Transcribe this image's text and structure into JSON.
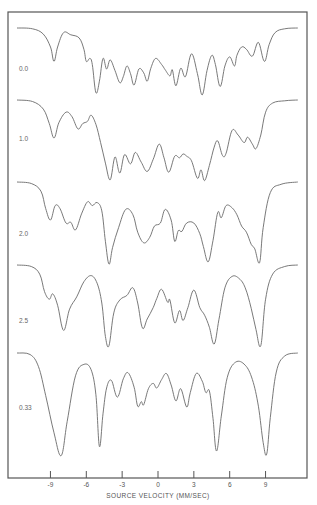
{
  "chart_data": {
    "type": "line",
    "title": "",
    "xlabel": "SOURCE VELOCITY (MM/SEC)",
    "ylabel": "",
    "xlim": [
      -12.5,
      12.3
    ],
    "xticks": [
      -9,
      -6,
      -3,
      0,
      3,
      6,
      9
    ],
    "xtick_labels": [
      "-9",
      "-6",
      "-3",
      "0",
      "3",
      "6",
      "9"
    ],
    "grid": false,
    "legend": "none; series labelled at left of each trace",
    "y_units": "relative transmission (baseline 0, absorption negative), traces offset vertically",
    "series": [
      {
        "name": "0.0",
        "label": "0.0",
        "points": [
          [
            -11.8,
            0
          ],
          [
            -10.5,
            -0.1
          ],
          [
            -9.6,
            -0.8
          ],
          [
            -9.0,
            -2.5
          ],
          [
            -8.7,
            -4.4
          ],
          [
            -8.4,
            -2.5
          ],
          [
            -7.9,
            -0.6
          ],
          [
            -7.3,
            -0.9
          ],
          [
            -6.6,
            -1.3
          ],
          [
            -6.2,
            -2.8
          ],
          [
            -6.0,
            -4.4
          ],
          [
            -5.7,
            -4.0
          ],
          [
            -5.5,
            -4.8
          ],
          [
            -5.2,
            -8.5
          ],
          [
            -4.9,
            -7.0
          ],
          [
            -4.6,
            -4.0
          ],
          [
            -4.3,
            -5.4
          ],
          [
            -4.0,
            -4.2
          ],
          [
            -3.6,
            -5.6
          ],
          [
            -3.2,
            -7.2
          ],
          [
            -2.9,
            -6.4
          ],
          [
            -2.6,
            -5.0
          ],
          [
            -2.3,
            -6.0
          ],
          [
            -2.0,
            -7.5
          ],
          [
            -1.6,
            -5.4
          ],
          [
            -1.2,
            -5.9
          ],
          [
            -0.9,
            -7.0
          ],
          [
            -0.6,
            -5.3
          ],
          [
            -0.2,
            -4.0
          ],
          [
            0.3,
            -4.8
          ],
          [
            0.6,
            -5.5
          ],
          [
            1.0,
            -6.3
          ],
          [
            1.2,
            -5.5
          ],
          [
            1.5,
            -7.6
          ],
          [
            1.9,
            -5.3
          ],
          [
            2.3,
            -6.4
          ],
          [
            2.8,
            -3.4
          ],
          [
            3.3,
            -6.0
          ],
          [
            3.7,
            -8.8
          ],
          [
            4.1,
            -5.6
          ],
          [
            4.5,
            -3.6
          ],
          [
            4.8,
            -4.8
          ],
          [
            5.2,
            -7.7
          ],
          [
            5.6,
            -5.0
          ],
          [
            6.0,
            -3.8
          ],
          [
            6.4,
            -5.0
          ],
          [
            6.6,
            -3.6
          ],
          [
            7.0,
            -2.5
          ],
          [
            7.4,
            -2.8
          ],
          [
            7.9,
            -3.7
          ],
          [
            8.4,
            -1.9
          ],
          [
            8.9,
            -4.4
          ],
          [
            9.3,
            -2.2
          ],
          [
            9.8,
            -0.6
          ],
          [
            10.6,
            -0.1
          ],
          [
            11.7,
            0
          ]
        ]
      },
      {
        "name": "1.0",
        "label": "1.0",
        "points": [
          [
            -11.8,
            0
          ],
          [
            -10.5,
            -0.2
          ],
          [
            -9.6,
            -1.2
          ],
          [
            -9.1,
            -3.1
          ],
          [
            -8.7,
            -5.0
          ],
          [
            -8.3,
            -3.0
          ],
          [
            -7.7,
            -1.6
          ],
          [
            -7.2,
            -2.2
          ],
          [
            -6.7,
            -3.8
          ],
          [
            -6.3,
            -3.1
          ],
          [
            -5.9,
            -2.8
          ],
          [
            -5.6,
            -2.0
          ],
          [
            -5.2,
            -3.2
          ],
          [
            -4.8,
            -5.6
          ],
          [
            -4.4,
            -8.3
          ],
          [
            -4.0,
            -10.5
          ],
          [
            -3.6,
            -7.5
          ],
          [
            -3.2,
            -9.6
          ],
          [
            -2.8,
            -7.2
          ],
          [
            -2.3,
            -8.4
          ],
          [
            -1.9,
            -6.9
          ],
          [
            -1.4,
            -8.2
          ],
          [
            -0.9,
            -9.4
          ],
          [
            -0.4,
            -7.8
          ],
          [
            0.1,
            -5.8
          ],
          [
            0.5,
            -7.6
          ],
          [
            0.9,
            -9.5
          ],
          [
            1.4,
            -7.4
          ],
          [
            1.8,
            -7.6
          ],
          [
            2.1,
            -7.1
          ],
          [
            2.4,
            -7.4
          ],
          [
            2.8,
            -8.0
          ],
          [
            3.3,
            -10.3
          ],
          [
            3.6,
            -9.2
          ],
          [
            3.9,
            -10.6
          ],
          [
            4.3,
            -8.6
          ],
          [
            4.7,
            -6.2
          ],
          [
            5.0,
            -5.4
          ],
          [
            5.4,
            -7.3
          ],
          [
            5.7,
            -7.0
          ],
          [
            6.2,
            -4.0
          ],
          [
            6.7,
            -4.6
          ],
          [
            7.2,
            -5.6
          ],
          [
            7.5,
            -4.9
          ],
          [
            7.9,
            -5.8
          ],
          [
            8.2,
            -6.4
          ],
          [
            8.6,
            -4.6
          ],
          [
            9.0,
            -1.6
          ],
          [
            9.6,
            -0.4
          ],
          [
            10.6,
            -0.1
          ],
          [
            11.7,
            0
          ]
        ]
      },
      {
        "name": "2.0",
        "label": "2.0",
        "points": [
          [
            -11.8,
            0
          ],
          [
            -10.6,
            -0.2
          ],
          [
            -9.8,
            -1.2
          ],
          [
            -9.4,
            -3.5
          ],
          [
            -9.0,
            -5.0
          ],
          [
            -8.6,
            -3.1
          ],
          [
            -8.2,
            -3.5
          ],
          [
            -7.7,
            -5.4
          ],
          [
            -7.3,
            -5.3
          ],
          [
            -6.9,
            -6.3
          ],
          [
            -6.4,
            -4.2
          ],
          [
            -5.9,
            -2.6
          ],
          [
            -5.5,
            -3.1
          ],
          [
            -5.1,
            -2.7
          ],
          [
            -4.7,
            -3.8
          ],
          [
            -4.4,
            -7.8
          ],
          [
            -4.1,
            -10.8
          ],
          [
            -3.8,
            -8.6
          ],
          [
            -3.3,
            -6.0
          ],
          [
            -2.7,
            -3.6
          ],
          [
            -2.1,
            -4.3
          ],
          [
            -1.7,
            -6.6
          ],
          [
            -1.2,
            -8.0
          ],
          [
            -0.7,
            -7.3
          ],
          [
            -0.3,
            -5.8
          ],
          [
            0.2,
            -5.4
          ],
          [
            0.6,
            -3.6
          ],
          [
            1.1,
            -5.0
          ],
          [
            1.4,
            -7.8
          ],
          [
            1.7,
            -6.4
          ],
          [
            2.0,
            -6.5
          ],
          [
            2.4,
            -5.4
          ],
          [
            3.0,
            -5.4
          ],
          [
            3.5,
            -6.8
          ],
          [
            3.8,
            -8.5
          ],
          [
            4.2,
            -10.5
          ],
          [
            4.6,
            -7.7
          ],
          [
            5.0,
            -4.0
          ],
          [
            5.3,
            -4.7
          ],
          [
            5.7,
            -3.1
          ],
          [
            6.2,
            -3.4
          ],
          [
            6.6,
            -4.3
          ],
          [
            7.0,
            -5.8
          ],
          [
            7.4,
            -6.6
          ],
          [
            7.8,
            -8.2
          ],
          [
            8.1,
            -8.8
          ],
          [
            8.5,
            -10.6
          ],
          [
            8.8,
            -6.0
          ],
          [
            9.4,
            -1.4
          ],
          [
            10.3,
            -0.3
          ],
          [
            11.7,
            0
          ]
        ]
      },
      {
        "name": "2.5",
        "label": "2.5",
        "points": [
          [
            -11.8,
            0
          ],
          [
            -10.6,
            -0.2
          ],
          [
            -9.9,
            -1.2
          ],
          [
            -9.5,
            -3.5
          ],
          [
            -9.1,
            -4.5
          ],
          [
            -8.8,
            -3.8
          ],
          [
            -8.4,
            -5.3
          ],
          [
            -7.9,
            -8.6
          ],
          [
            -7.4,
            -5.8
          ],
          [
            -6.8,
            -4.2
          ],
          [
            -6.2,
            -2.2
          ],
          [
            -5.6,
            -1.4
          ],
          [
            -5.1,
            -2.4
          ],
          [
            -4.7,
            -5.0
          ],
          [
            -4.4,
            -9.4
          ],
          [
            -4.1,
            -10.6
          ],
          [
            -3.7,
            -6.3
          ],
          [
            -3.2,
            -4.6
          ],
          [
            -2.6,
            -4.0
          ],
          [
            -2.1,
            -3.0
          ],
          [
            -1.7,
            -5.0
          ],
          [
            -1.3,
            -8.3
          ],
          [
            -0.9,
            -7.1
          ],
          [
            -0.4,
            -5.6
          ],
          [
            -0.1,
            -4.4
          ],
          [
            0.3,
            -3.2
          ],
          [
            0.8,
            -4.9
          ],
          [
            1.0,
            -4.6
          ],
          [
            1.4,
            -7.6
          ],
          [
            1.8,
            -6.0
          ],
          [
            2.1,
            -7.3
          ],
          [
            2.5,
            -5.6
          ],
          [
            3.0,
            -3.3
          ],
          [
            3.5,
            -5.6
          ],
          [
            3.9,
            -6.6
          ],
          [
            4.3,
            -8.2
          ],
          [
            4.7,
            -10.4
          ],
          [
            5.1,
            -7.2
          ],
          [
            5.6,
            -3.0
          ],
          [
            6.2,
            -1.5
          ],
          [
            6.8,
            -1.8
          ],
          [
            7.3,
            -3.0
          ],
          [
            7.8,
            -5.7
          ],
          [
            8.2,
            -8.5
          ],
          [
            8.6,
            -10.6
          ],
          [
            9.0,
            -4.5
          ],
          [
            9.6,
            -1.2
          ],
          [
            10.6,
            -0.2
          ],
          [
            11.7,
            0
          ]
        ]
      },
      {
        "name": "0.33",
        "label": "0.33",
        "points": [
          [
            -11.8,
            0
          ],
          [
            -10.7,
            -0.2
          ],
          [
            -10.0,
            -1.8
          ],
          [
            -9.4,
            -5.6
          ],
          [
            -8.7,
            -10.5
          ],
          [
            -8.1,
            -13.5
          ],
          [
            -7.6,
            -9.0
          ],
          [
            -6.9,
            -3.0
          ],
          [
            -6.2,
            -1.5
          ],
          [
            -5.6,
            -2.2
          ],
          [
            -5.2,
            -5.5
          ],
          [
            -4.9,
            -12.3
          ],
          [
            -4.6,
            -8.0
          ],
          [
            -4.3,
            -4.6
          ],
          [
            -3.9,
            -3.6
          ],
          [
            -3.4,
            -5.8
          ],
          [
            -2.9,
            -3.4
          ],
          [
            -2.5,
            -2.6
          ],
          [
            -2.0,
            -4.5
          ],
          [
            -1.7,
            -7.0
          ],
          [
            -1.4,
            -6.4
          ],
          [
            -1.2,
            -6.8
          ],
          [
            -0.8,
            -4.7
          ],
          [
            -0.4,
            -4.0
          ],
          [
            -0.1,
            -4.6
          ],
          [
            0.3,
            -3.5
          ],
          [
            0.7,
            -2.7
          ],
          [
            1.1,
            -4.2
          ],
          [
            1.5,
            -6.3
          ],
          [
            1.9,
            -4.7
          ],
          [
            2.4,
            -7.1
          ],
          [
            2.7,
            -5.2
          ],
          [
            3.2,
            -2.7
          ],
          [
            3.7,
            -3.7
          ],
          [
            4.0,
            -5.2
          ],
          [
            4.3,
            -5.0
          ],
          [
            4.6,
            -8.6
          ],
          [
            4.9,
            -12.9
          ],
          [
            5.3,
            -8.3
          ],
          [
            5.8,
            -3.2
          ],
          [
            6.5,
            -1.2
          ],
          [
            7.3,
            -1.6
          ],
          [
            7.9,
            -3.5
          ],
          [
            8.4,
            -7.0
          ],
          [
            8.8,
            -11.8
          ],
          [
            9.1,
            -13.3
          ],
          [
            9.4,
            -8.5
          ],
          [
            9.9,
            -2.5
          ],
          [
            10.6,
            -0.4
          ],
          [
            11.7,
            0
          ]
        ]
      }
    ]
  }
}
